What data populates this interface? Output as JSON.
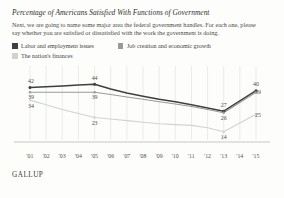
{
  "title": "Percentage of Americans Satisfied With Functions of Government",
  "subtitle": "Next, we are going to name some major area the federal government handles. For each one, please say whether you are satisfied or dissatisfied with the work the government is doing.",
  "footer": "GALLUP",
  "colors": {
    "labor": "#3f3f3f",
    "jobs": "#9a9a98",
    "finances": "#d2d2cf",
    "grid": "#e2e2de",
    "axis": "#b9b9b4",
    "background": "#fdfdfc"
  },
  "legend": [
    {
      "label": "Labor and employment issues",
      "color": "#3f3f3f",
      "key": "labor"
    },
    {
      "label": "Job creation and economic growth",
      "color": "#9a9a98",
      "key": "jobs"
    },
    {
      "label": "The nation's finances",
      "color": "#d2d2cf",
      "key": "finances"
    }
  ],
  "chart_data": {
    "type": "line",
    "title": "Percentage of Americans Satisfied With Functions of Government",
    "xlabel": "",
    "ylabel": "",
    "ylim": [
      10,
      48
    ],
    "grid": true,
    "legend_position": "top",
    "categories": [
      "'01",
      "'02",
      "'03",
      "'04",
      "'05",
      "'06",
      "'07",
      "'08",
      "'09",
      "'10",
      "'11",
      "'12",
      "'13",
      "'14",
      "'15"
    ],
    "series": [
      {
        "name": "Labor and employment issues",
        "color": "#3f3f3f",
        "values": [
          42,
          42.5,
          43,
          43.5,
          44,
          41,
          38.5,
          36.5,
          34.5,
          33,
          31,
          29,
          27,
          33.5,
          40
        ],
        "labeled_points": [
          {
            "category": "'01",
            "value": 42,
            "label": "42"
          },
          {
            "category": "'05",
            "value": 44,
            "label": "44"
          },
          {
            "category": "'13",
            "value": 27,
            "label": "27"
          },
          {
            "category": "'15",
            "value": 40,
            "label": "40"
          }
        ]
      },
      {
        "name": "Job creation and economic growth",
        "color": "#9a9a98",
        "values": [
          39,
          39,
          39,
          39,
          39,
          37.5,
          36,
          34.5,
          33,
          31.5,
          30,
          28,
          26,
          32.5,
          39
        ],
        "labeled_points": [
          {
            "category": "'01",
            "value": 39,
            "label": "39"
          },
          {
            "category": "'05",
            "value": 39,
            "label": "39"
          },
          {
            "category": "'13",
            "value": 26,
            "label": "26"
          },
          {
            "category": "'15",
            "value": 39,
            "label": "39"
          }
        ]
      },
      {
        "name": "The nation's finances",
        "color": "#d2d2cf",
        "values": [
          34,
          31,
          28,
          25.5,
          23,
          22,
          21,
          20,
          19,
          18.5,
          18,
          16.5,
          14,
          19.5,
          25
        ],
        "labeled_points": [
          {
            "category": "'01",
            "value": 34,
            "label": "34"
          },
          {
            "category": "'05",
            "value": 23,
            "label": "23"
          },
          {
            "category": "'13",
            "value": 14,
            "label": "14"
          },
          {
            "category": "'15",
            "value": 25,
            "label": "25"
          }
        ]
      }
    ]
  }
}
